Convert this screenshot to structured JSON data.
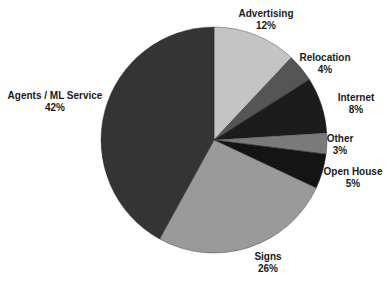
{
  "chart_data": {
    "type": "pie",
    "title": "",
    "start_angle_deg": 0,
    "direction": "clockwise",
    "slices": [
      {
        "label": "Advertising",
        "value": 12,
        "display": "12%",
        "color": "#c4c4c4"
      },
      {
        "label": "Relocation",
        "value": 4,
        "display": "4%",
        "color": "#555555"
      },
      {
        "label": "Internet",
        "value": 8,
        "display": "8%",
        "color": "#1c1c1c"
      },
      {
        "label": "Other",
        "value": 3,
        "display": "3%",
        "color": "#7a7a7a"
      },
      {
        "label": "Open House",
        "value": 5,
        "display": "5%",
        "color": "#141414"
      },
      {
        "label": "Signs",
        "value": 26,
        "display": "26%",
        "color": "#9a9a9a"
      },
      {
        "label": "Agents / ML Service",
        "value": 42,
        "display": "42%",
        "color": "#343434"
      }
    ],
    "labels_layout": [
      {
        "x": 266,
        "y": 8
      },
      {
        "x": 325,
        "y": 52
      },
      {
        "x": 356,
        "y": 92
      },
      {
        "x": 340,
        "y": 133
      },
      {
        "x": 353,
        "y": 166
      },
      {
        "x": 268,
        "y": 251
      },
      {
        "x": 55,
        "y": 90
      }
    ],
    "center": [
      214,
      140
    ],
    "radius": 113
  }
}
